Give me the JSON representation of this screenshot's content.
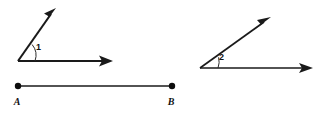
{
  "figure": {
    "background_color": "#ffffff",
    "ink_color": "#1a1a1a",
    "width": 320,
    "height": 113
  },
  "angle_one": {
    "label": "1",
    "label_x": 36,
    "label_y": 50,
    "vertex_x": 18,
    "vertex_y": 61,
    "upper_ray": {
      "name": "upper-ray",
      "tip_x": 56,
      "tip_y": 8,
      "has_arrowhead": true
    },
    "horizontal_ray": {
      "name": "horizontal-ray",
      "tip_x": 113,
      "tip_y": 61,
      "has_arrowhead": true
    },
    "arc": {
      "radius": 17,
      "start_x": 31,
      "start_y": 44,
      "end_x": 35,
      "end_y": 61
    },
    "measure_degrees": 54
  },
  "angle_two": {
    "label": "2",
    "label_x": 219,
    "label_y": 60,
    "vertex_x": 200,
    "vertex_y": 68,
    "upper_ray": {
      "name": "upper-ray",
      "tip_x": 271,
      "tip_y": 17,
      "has_arrowhead": true
    },
    "horizontal_ray": {
      "name": "horizontal-ray",
      "tip_x": 313,
      "tip_y": 68,
      "has_arrowhead": true
    },
    "arc": {
      "radius": 18,
      "start_x": 218,
      "start_y": 56,
      "end_x": 218,
      "end_y": 68
    },
    "measure_degrees": 36
  },
  "segment": {
    "name": "segment-AB",
    "start_label": "A",
    "end_label": "B",
    "start_x": 18,
    "start_y": 86,
    "end_x": 172,
    "end_y": 86,
    "start_label_x": 17,
    "start_label_y": 104,
    "end_label_x": 171,
    "end_label_y": 104,
    "endpoint_radius": 3.2
  }
}
